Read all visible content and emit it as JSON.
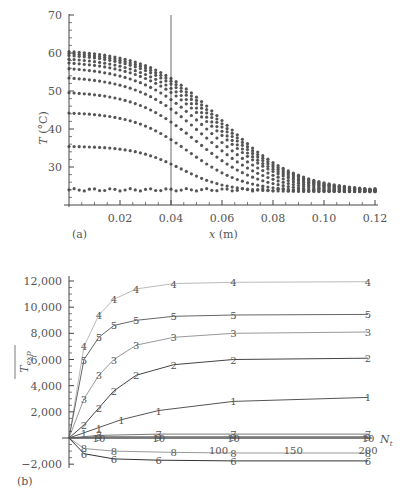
{
  "chart_data": [
    {
      "panel_label": "(a)",
      "type": "scatter",
      "title": "",
      "xlabel": "x (m)",
      "ylabel": "T (°C)",
      "xlim": [
        0,
        0.12
      ],
      "ylim": [
        20,
        70
      ],
      "xticks": [
        0.02,
        0.04,
        0.06,
        0.08,
        0.1,
        0.12
      ],
      "xtick_labels": [
        "0.02",
        "0.04",
        "0.06",
        "0.08",
        "0.10",
        "0.12"
      ],
      "yticks": [
        30,
        40,
        50,
        60,
        70
      ],
      "ytick_labels": [
        "30",
        "40",
        "50",
        "60",
        "70"
      ],
      "grid": false,
      "vertical_line_x": 0.04,
      "description": "Temperature profiles at successive times; plateau near x=0 then decay toward ~23 °C by x=0.12",
      "series": [
        {
          "name": "t1",
          "plateau": 24,
          "x_drop": 0.05,
          "end": 24
        },
        {
          "name": "t2",
          "plateau": 35.5,
          "x_drop": 0.032,
          "end": 23.5
        },
        {
          "name": "t3",
          "plateau": 44.5,
          "x_drop": 0.035,
          "end": 23.5
        },
        {
          "name": "t4",
          "plateau": 50,
          "x_drop": 0.038,
          "end": 23.5
        },
        {
          "name": "t5",
          "plateau": 54,
          "x_drop": 0.04,
          "end": 23.5
        },
        {
          "name": "t6",
          "plateau": 56.5,
          "x_drop": 0.042,
          "end": 23.5
        },
        {
          "name": "t7",
          "plateau": 58,
          "x_drop": 0.044,
          "end": 23.5
        },
        {
          "name": "t8",
          "plateau": 59,
          "x_drop": 0.045,
          "end": 23.5
        },
        {
          "name": "t9",
          "plateau": 60,
          "x_drop": 0.046,
          "end": 23.5
        },
        {
          "name": "t10",
          "plateau": 60.5,
          "x_drop": 0.047,
          "end": 23.5
        },
        {
          "name": "t11",
          "plateau": 61,
          "x_drop": 0.048,
          "end": 23.5
        }
      ]
    },
    {
      "panel_label": "(b)",
      "type": "line",
      "title": "",
      "xlabel": "N_t",
      "ylabel": "T_exp (overline)",
      "xlim": [
        0,
        200
      ],
      "ylim": [
        -2000,
        12000
      ],
      "yticks": [
        -2000,
        2000,
        4000,
        6000,
        8000,
        10000,
        12000
      ],
      "ytick_labels": [
        "−2,000",
        "2,000",
        "4,000",
        "6,000",
        "8,000",
        "10,000",
        "12,000"
      ],
      "xtick_labels_inline": [
        "100",
        "150",
        "200"
      ],
      "grid": false,
      "series": [
        {
          "name": "4",
          "color": "#bbbbbb",
          "x": [
            0,
            10,
            20,
            30,
            45,
            70,
            110,
            200
          ],
          "values": [
            0,
            7000,
            9400,
            10600,
            11400,
            11800,
            11900,
            11950
          ]
        },
        {
          "name": "5",
          "color": "#666666",
          "x": [
            0,
            10,
            20,
            30,
            45,
            70,
            110,
            200
          ],
          "values": [
            0,
            6000,
            7700,
            8600,
            9000,
            9300,
            9400,
            9450
          ]
        },
        {
          "name": "3",
          "color": "#999999",
          "x": [
            0,
            10,
            20,
            30,
            45,
            70,
            110,
            200
          ],
          "values": [
            0,
            3000,
            4800,
            6000,
            7100,
            7700,
            8000,
            8100
          ]
        },
        {
          "name": "2",
          "color": "#444444",
          "x": [
            0,
            10,
            20,
            30,
            45,
            70,
            110,
            200
          ],
          "values": [
            0,
            1000,
            2300,
            3600,
            4800,
            5600,
            6000,
            6100
          ]
        },
        {
          "name": "1",
          "color": "#555555",
          "x": [
            0,
            10,
            20,
            35,
            60,
            110,
            200
          ],
          "values": [
            0,
            400,
            800,
            1400,
            2100,
            2800,
            3100
          ]
        },
        {
          "name": "7",
          "color": "#777777",
          "x": [
            0,
            20,
            60,
            110,
            200
          ],
          "values": [
            0,
            200,
            300,
            300,
            300
          ]
        },
        {
          "name": "9",
          "color": "#777777",
          "x": [
            0,
            20,
            60,
            110,
            200
          ],
          "values": [
            0,
            100,
            100,
            100,
            100
          ]
        },
        {
          "name": "10",
          "color": "#777777",
          "x": [
            0,
            20,
            60,
            110,
            200
          ],
          "values": [
            0,
            0,
            0,
            0,
            0
          ]
        },
        {
          "name": "8",
          "color": "#999999",
          "x": [
            0,
            10,
            30,
            70,
            110,
            200
          ],
          "values": [
            0,
            -800,
            -1000,
            -1100,
            -1150,
            -1150
          ]
        },
        {
          "name": "6",
          "color": "#333333",
          "x": [
            0,
            10,
            30,
            60,
            110,
            200
          ],
          "values": [
            0,
            -1200,
            -1600,
            -1700,
            -1750,
            -1750
          ]
        }
      ]
    }
  ],
  "labels": {
    "panel_a": "(a)",
    "panel_b": "(b)",
    "xlabel_a_var": "x",
    "xlabel_a_unit": " (m)",
    "ylabel_a_var": "T",
    "ylabel_a_unit": " (°C)",
    "ylabel_b_main": "T",
    "ylabel_b_sub": "exp",
    "xlabel_b_main": "N",
    "xlabel_b_sub": "t"
  }
}
